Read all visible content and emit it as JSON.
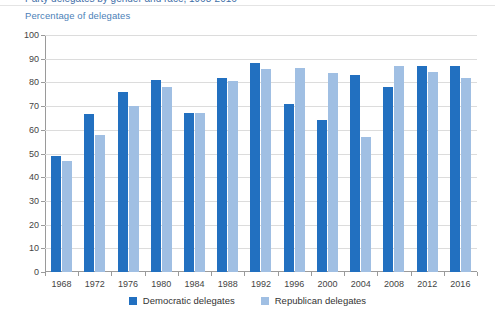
{
  "top_clipped_title": "Party delegates by gender and race, 1968-2016",
  "axis_title": "Percentage of delegates",
  "legend": {
    "items": [
      {
        "label": "Democratic delegates",
        "color": "#2270c0",
        "swatch": "dem"
      },
      {
        "label": "Republican delegates",
        "color": "#a0bfe3",
        "swatch": "rep"
      }
    ]
  },
  "colors": {
    "democratic": "#2270c0",
    "republican": "#a0bfe3",
    "axis_title": "#4c7fb8",
    "gridline": "#dcdcdc",
    "axis": "#9a9a9a",
    "tick_text": "#444444",
    "background": "#ffffff"
  },
  "chart_data": {
    "type": "bar",
    "title": "",
    "subtitle": "",
    "xlabel": "",
    "ylabel": "Percentage of delegates",
    "ylim": [
      0,
      100
    ],
    "yticks": [
      0,
      10,
      20,
      30,
      40,
      50,
      60,
      70,
      80,
      90,
      100
    ],
    "ytick_labels": [
      "0",
      "10",
      "20",
      "30",
      "40",
      "50",
      "60",
      "70",
      "80",
      "90",
      "100"
    ],
    "grid": true,
    "legend_position": "bottom-center",
    "categories": [
      "1968",
      "1972",
      "1976",
      "1980",
      "1984",
      "1988",
      "1992",
      "1996",
      "2000",
      "2004",
      "2008",
      "2012",
      "2016"
    ],
    "series": [
      {
        "name": "Democratic delegates",
        "color": "#2270c0",
        "values": [
          49,
          66.5,
          76,
          81,
          67,
          82,
          88,
          71,
          64,
          83,
          78,
          87,
          87
        ]
      },
      {
        "name": "Republican delegates",
        "color": "#a0bfe3",
        "values": [
          47,
          58,
          70,
          78,
          67,
          80.5,
          85.5,
          86,
          84,
          57,
          87,
          84.5,
          82
        ]
      }
    ]
  }
}
